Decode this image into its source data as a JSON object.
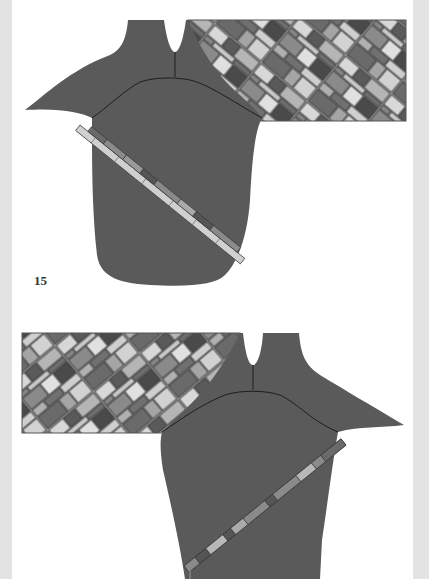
{
  "page": {
    "figure_number": "15",
    "background": "#ffffff",
    "margin_color": "#e3e3e3"
  },
  "figures": [
    {
      "name": "figure-15-top",
      "description": "Sweater body with diagonal mosaic sleeve extending right and diagonal strip across body",
      "body_color": "#5a5a5a",
      "sleeve_side": "right",
      "strip_angle": "down-right"
    },
    {
      "name": "figure-bottom",
      "description": "Sweater body with diagonal mosaic sleeve extending left and diagonal strip across body",
      "body_color": "#5a5a5a",
      "sleeve_side": "left",
      "strip_angle": "up-right"
    }
  ],
  "palette": {
    "body": "#5a5a5a",
    "outline": "#2a2a2a",
    "tile_dark": "#4a4a4a",
    "tile_mid": "#858585",
    "tile_light": "#b5b5b5",
    "tile_pale": "#d8d8d8"
  }
}
